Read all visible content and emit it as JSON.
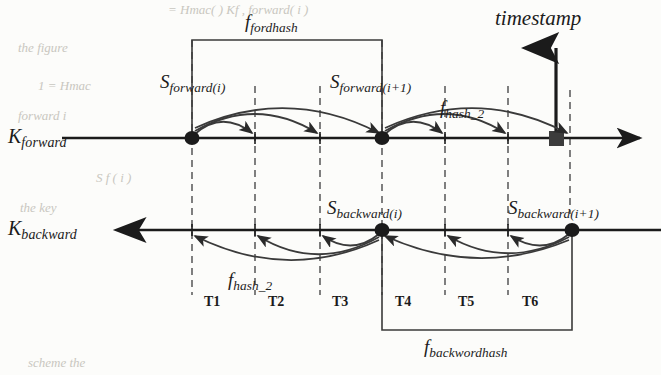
{
  "figure": {
    "type": "timeline-diagram",
    "title_text": "",
    "background_color": "#fcfcfa",
    "ink_color": "#1b1b1b"
  },
  "axes": [
    {
      "id": "forward",
      "label_main": "K",
      "label_sub": "forward",
      "direction": "right",
      "y": 138,
      "x_start": 62,
      "x_end": 650
    },
    {
      "id": "backward",
      "label_main": "K",
      "label_sub": "backward",
      "direction": "left",
      "y": 230,
      "x_start": 58,
      "x_end": 661
    }
  ],
  "timestamp": {
    "label": "timestamp",
    "marker_shape": "square",
    "marker_x": 556,
    "marker_y": 138,
    "arrow_top_y": 40
  },
  "nodes": [
    {
      "id": "s-forward-i",
      "main": "S",
      "sub": "forward(i)",
      "axis": "forward",
      "x": 192,
      "shape": "dot"
    },
    {
      "id": "s-forward-i1",
      "main": "S",
      "sub": "forward(i+1)",
      "axis": "forward",
      "x": 382,
      "shape": "dot"
    },
    {
      "id": "s-backward-i",
      "main": "S",
      "sub": "backward(i)",
      "axis": "backward",
      "x": 382,
      "shape": "dot"
    },
    {
      "id": "s-backward-i1",
      "main": "S",
      "sub": "backward(i+1)",
      "axis": "backward",
      "x": 572,
      "shape": "dot"
    }
  ],
  "brackets": [
    {
      "id": "fordhash",
      "main": "f",
      "sub": "fordhash",
      "x_left": 192,
      "x_right": 382,
      "edge_y": 40,
      "side": "top",
      "label_x": 245,
      "label_y": 14
    },
    {
      "id": "backwordhash",
      "main": "f",
      "sub": "backwordhash",
      "x_left": 382,
      "x_right": 572,
      "edge_y": 330,
      "side": "bottom",
      "label_x": 432,
      "label_y": 339
    }
  ],
  "hash_labels": [
    {
      "id": "hash2-forward",
      "main": "f",
      "sub": "hash_2",
      "x": 440,
      "y": 100
    },
    {
      "id": "hash2-backward",
      "main": "f",
      "sub": "hash_2",
      "x": 228,
      "y": 272
    }
  ],
  "dashed_lines_x": [
    192,
    255,
    320,
    382,
    445,
    508,
    570
  ],
  "intervals": [
    {
      "label": "T1",
      "x": 215,
      "y": 295
    },
    {
      "label": "T2",
      "x": 279,
      "y": 295
    },
    {
      "label": "T3",
      "x": 343,
      "y": 295
    },
    {
      "label": "T4",
      "x": 406,
      "y": 295
    },
    {
      "label": "T5",
      "x": 469,
      "y": 295
    },
    {
      "label": "T6",
      "x": 533,
      "y": 295
    }
  ],
  "arcs": {
    "forward_group_1": {
      "from_x": 192,
      "to_x": [
        255,
        320,
        382
      ],
      "axis_y": 138,
      "direction": "right"
    },
    "forward_group_2": {
      "from_x": 382,
      "to_x": [
        445,
        508,
        570
      ],
      "axis_y": 138,
      "direction": "right"
    },
    "backward_group_1": {
      "from_x": 382,
      "to_x": [
        320,
        255,
        192
      ],
      "axis_y": 230,
      "direction": "left"
    },
    "backward_group_2": {
      "from_x": 572,
      "to_x": [
        508,
        445,
        382
      ],
      "axis_y": 230,
      "direction": "left"
    }
  },
  "ghost_text": [
    {
      "text": "= Hmac( ) Kf , forward( i )",
      "x": 168,
      "y": 2
    },
    {
      "text": "the figure",
      "x": 18,
      "y": 40
    },
    {
      "text": "1  = Hmac",
      "x": 38,
      "y": 78
    },
    {
      "text": "forward  i",
      "x": 18,
      "y": 108
    },
    {
      "text": "S f  ( i )",
      "x": 96,
      "y": 170
    },
    {
      "text": "the  key",
      "x": 20,
      "y": 200
    },
    {
      "text": "scheme  the",
      "x": 28,
      "y": 355
    }
  ]
}
